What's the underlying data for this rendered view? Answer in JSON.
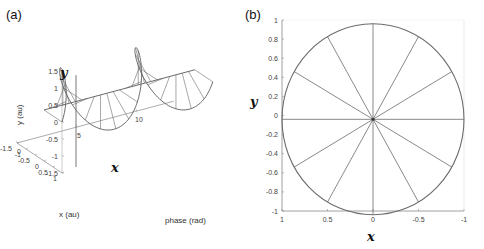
{
  "chart_data": [
    {
      "panel": "(a)",
      "type": "line",
      "projection": "3d",
      "description": "Rotating vector: circle in x-y plane traced along phase axis, with spokes",
      "xlabel": "phase (rad)",
      "ylabel": "y (au)",
      "zlabel": "x (au)",
      "phase_ticks": [
        "0",
        "5",
        "10"
      ],
      "phase_range": [
        0,
        12.566
      ],
      "x_ticks": [
        "1",
        "0.5",
        "0",
        "-0.5",
        "-1",
        "-1.5"
      ],
      "x_range": [
        1,
        -1.5
      ],
      "y_ticks": [
        "1.5",
        "1",
        "0.5",
        "0",
        "-0.5",
        "-1",
        "-1.5"
      ],
      "y_range": [
        -1.5,
        1.5
      ],
      "annotations": [
        "y",
        "x"
      ],
      "series": [
        {
          "name": "helix",
          "amplitude": 1,
          "cycles": 2,
          "points_per_cycle": 12
        }
      ]
    },
    {
      "panel": "(b)",
      "type": "line",
      "description": "Projection onto x-y plane: unit circle with 12 radial spokes at 30 degree steps",
      "xlabel": "x",
      "ylabel": "y",
      "x_ticks": [
        "1",
        "0.5",
        "0",
        "-0.5",
        "-1"
      ],
      "x_range": [
        1,
        -1
      ],
      "y_ticks": [
        "1",
        "0.8",
        "0.6",
        "0.4",
        "0.2",
        "0",
        "-0.2",
        "-0.4",
        "-0.6",
        "-0.8",
        "-1"
      ],
      "y_range": [
        -1,
        1
      ],
      "grid": false,
      "series": [
        {
          "name": "circle",
          "radius": 1,
          "center": [
            0,
            -0.04
          ]
        },
        {
          "name": "spokes",
          "angles_deg": [
            0,
            30,
            60,
            90,
            120,
            150,
            180,
            210,
            240,
            270,
            300,
            330
          ]
        }
      ]
    }
  ],
  "labels": {
    "panel_a": "(a)",
    "panel_b": "(b)",
    "a_var_y": "y",
    "a_var_x": "x",
    "b_var_y": "y",
    "b_var_x": "x",
    "a_xlabel": "phase (rad)",
    "a_ylabel": "y (au)",
    "a_zlabel": "x (au)"
  },
  "colors": {
    "curve": "#6b6b6b",
    "axis": "#888888",
    "text": "#333333"
  }
}
